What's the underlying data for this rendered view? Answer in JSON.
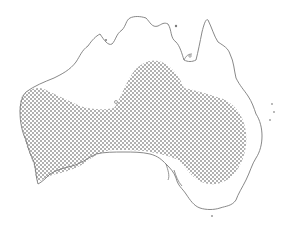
{
  "map": {
    "subject": "Australia",
    "type": "species distribution map",
    "style": "stippled range over coastline outline",
    "colors": {
      "background": "#ffffff",
      "coastline": "#7a7a7a",
      "stipple": "#3a3a3a"
    },
    "layers": [
      {
        "name": "coastline",
        "description": "Outline of mainland Australia"
      },
      {
        "name": "distribution-range",
        "description": "Dotted region across southern Western Australia, South Australia, and extending north-east into the interior"
      }
    ]
  }
}
